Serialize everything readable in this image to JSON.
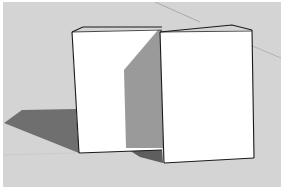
{
  "viewport": {
    "label": "3D model viewport",
    "background_color": "#d3d3d3",
    "ground_color": "#cbcbcb",
    "shadow_color": "#6e6e6e",
    "shaded_face_color": "#9a9a9a",
    "lit_face_color": "#ffffff",
    "edge_color": "#1a1a1a"
  },
  "scene": {
    "objects": [
      {
        "name": "left-box",
        "description": "White rectangular box"
      },
      {
        "name": "right-box",
        "description": "White rectangular box"
      }
    ]
  }
}
